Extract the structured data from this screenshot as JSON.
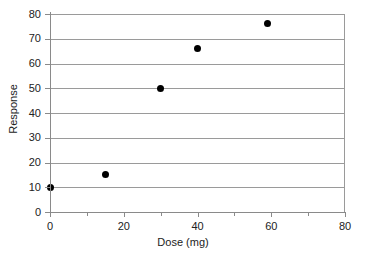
{
  "chart_data": {
    "type": "scatter",
    "title": "",
    "xlabel": "Dose (mg)",
    "ylabel": "Response",
    "xlim": [
      0,
      80
    ],
    "ylim": [
      0,
      80
    ],
    "xticks": [
      0,
      20,
      40,
      60,
      80
    ],
    "xticks_minor": [
      10,
      30,
      50,
      70
    ],
    "yticks": [
      0,
      10,
      20,
      30,
      40,
      50,
      60,
      70,
      80
    ],
    "xtick_labels": [
      "0",
      "20",
      "40",
      "60",
      "80"
    ],
    "ytick_labels": [
      "0",
      "10",
      "20",
      "30",
      "40",
      "50",
      "60",
      "70",
      "80"
    ],
    "grid": "horizontal",
    "legend": "none",
    "marker": "filled-circle",
    "marker_color": "#000000",
    "grid_color": "#9a9a9a",
    "axis_color": "#8a8a8a",
    "background": "#ffffff",
    "x": [
      0,
      15,
      30,
      40,
      59
    ],
    "y": [
      10,
      15,
      50,
      66,
      76
    ],
    "points": [
      {
        "x": 0,
        "y": 10
      },
      {
        "x": 15,
        "y": 15
      },
      {
        "x": 30,
        "y": 50
      },
      {
        "x": 40,
        "y": 66
      },
      {
        "x": 59,
        "y": 76
      }
    ]
  }
}
